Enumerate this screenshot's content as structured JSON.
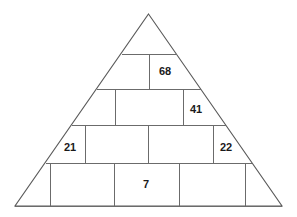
{
  "figure": {
    "type": "pyramid-number-puzzle",
    "shape": "triangle",
    "title": "",
    "stroke_color": "#6b6b6b",
    "outline_color": "#5a5a5a",
    "background_color": "#ffffff",
    "text_color": "#1a1a1a"
  },
  "geometry": {
    "apex": {
      "x": 148.5,
      "y": 14
    },
    "base_left": {
      "x": 15,
      "y": 206
    },
    "base_right": {
      "x": 282,
      "y": 206
    },
    "row_lines_y": [
      54,
      89,
      125,
      163,
      206
    ]
  },
  "rows": [
    {
      "index": 0,
      "label": "row-1",
      "top": 54,
      "bottom": 89,
      "dividers_x": [
        149
      ],
      "cells": [
        {
          "label": "",
          "value": "",
          "cx": 131,
          "cy": 72,
          "filled": false
        },
        {
          "label": "68",
          "value": "68",
          "cx": 165,
          "cy": 72,
          "filled": true
        }
      ]
    },
    {
      "index": 1,
      "label": "row-2",
      "top": 89,
      "bottom": 125,
      "dividers_x": [
        115,
        183
      ],
      "cells": [
        {
          "label": "",
          "value": "",
          "cx": 104,
          "cy": 107,
          "filled": false
        },
        {
          "label": "",
          "value": "",
          "cx": 149,
          "cy": 107,
          "filled": false
        },
        {
          "label": "41",
          "value": "41",
          "cx": 196,
          "cy": 110,
          "filled": true
        }
      ]
    },
    {
      "index": 2,
      "label": "row-3",
      "top": 125,
      "bottom": 163,
      "dividers_x": [
        85,
        148,
        213
      ],
      "cells": [
        {
          "label": "21",
          "value": "21",
          "cx": 70,
          "cy": 148,
          "filled": true
        },
        {
          "label": "",
          "value": "",
          "cx": 116,
          "cy": 145,
          "filled": false
        },
        {
          "label": "",
          "value": "",
          "cx": 180,
          "cy": 145,
          "filled": false
        },
        {
          "label": "22",
          "value": "22",
          "cx": 226,
          "cy": 148,
          "filled": true
        }
      ]
    },
    {
      "index": 3,
      "label": "row-4",
      "top": 163,
      "bottom": 206,
      "dividers_x": [
        50,
        114,
        179,
        245
      ],
      "cells": [
        {
          "label": "",
          "value": "",
          "cx": 32,
          "cy": 186,
          "filled": false
        },
        {
          "label": "",
          "value": "",
          "cx": 82,
          "cy": 186,
          "filled": false
        },
        {
          "label": "7",
          "value": "7",
          "cx": 146,
          "cy": 185,
          "filled": true
        },
        {
          "label": "",
          "value": "",
          "cx": 212,
          "cy": 186,
          "filled": false
        },
        {
          "label": "",
          "value": "",
          "cx": 263,
          "cy": 186,
          "filled": false
        }
      ]
    }
  ],
  "values": {
    "v68": "68",
    "v41": "41",
    "v21": "21",
    "v22": "22",
    "v7": "7"
  }
}
